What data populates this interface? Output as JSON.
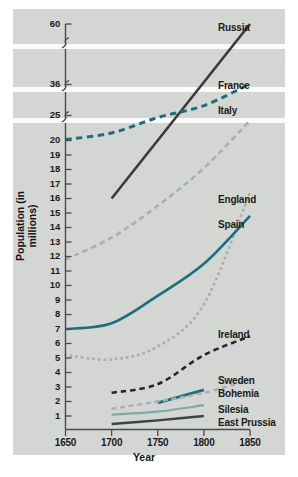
{
  "chart_data": {
    "type": "line",
    "title": "",
    "xlabel": "Year",
    "ylabel": "Population (in millions)",
    "grid": false,
    "legend_position": "right-inline-labels",
    "x_ticks": [
      "1650",
      "1700",
      "1750",
      "1800",
      "1850"
    ],
    "xlim": [
      1650,
      1850
    ],
    "y_ticks": [
      "1",
      "2",
      "3",
      "4",
      "5",
      "6",
      "7",
      "8",
      "9",
      "10",
      "11",
      "12",
      "13",
      "14",
      "15",
      "16",
      "17",
      "18",
      "19",
      "20",
      "25",
      "36",
      "60"
    ],
    "y_axis_note": "broken axis: three break marks between 20 and 25, between 25 and 36, and between 36 and 60",
    "series": [
      {
        "name": "Russia",
        "style": "solid",
        "color": "#3a3a3c",
        "width": 2.6,
        "points": [
          [
            1700,
            16.0
          ],
          [
            1850,
            60.0
          ]
        ]
      },
      {
        "name": "France",
        "style": "dashed",
        "color": "#1b6f7e",
        "width": 3.0,
        "points": [
          [
            1650,
            20.2
          ],
          [
            1700,
            21.5
          ],
          [
            1750,
            24.6
          ],
          [
            1800,
            28.5
          ],
          [
            1850,
            36.3
          ]
        ]
      },
      {
        "name": "Italy",
        "style": "dashed",
        "color": "#a9aeb0",
        "width": 2.6,
        "points": [
          [
            1650,
            11.8
          ],
          [
            1700,
            13.3
          ],
          [
            1750,
            15.5
          ],
          [
            1800,
            18.1
          ],
          [
            1850,
            24.0
          ]
        ]
      },
      {
        "name": "England",
        "style": "dotted",
        "color": "#a9aeb0",
        "width": 3.0,
        "points": [
          [
            1650,
            5.2
          ],
          [
            1700,
            4.9
          ],
          [
            1750,
            5.8
          ],
          [
            1800,
            8.7
          ],
          [
            1850,
            16.4
          ]
        ]
      },
      {
        "name": "Spain",
        "style": "solid",
        "color": "#1b6f7e",
        "width": 2.6,
        "points": [
          [
            1650,
            7.0
          ],
          [
            1700,
            7.4
          ],
          [
            1750,
            9.3
          ],
          [
            1800,
            11.5
          ],
          [
            1850,
            14.8
          ]
        ]
      },
      {
        "name": "Ireland",
        "style": "dashed",
        "color": "#26262a",
        "width": 2.6,
        "points": [
          [
            1700,
            2.6
          ],
          [
            1750,
            3.2
          ],
          [
            1800,
            5.2
          ],
          [
            1850,
            6.5
          ]
        ]
      },
      {
        "name": "Sweden",
        "style": "solid",
        "color": "#1b6f7e",
        "width": 2.8,
        "points": [
          [
            1750,
            1.9
          ],
          [
            1800,
            2.8
          ]
        ]
      },
      {
        "name": "Bohemia",
        "style": "dashed",
        "color": "#a9aeb0",
        "width": 2.4,
        "points": [
          [
            1700,
            1.5
          ],
          [
            1750,
            2.0
          ],
          [
            1800,
            2.6
          ],
          [
            1850,
            3.5
          ]
        ]
      },
      {
        "name": "Silesia",
        "style": "solid",
        "color": "#7fa8ad",
        "width": 2.2,
        "points": [
          [
            1700,
            1.1
          ],
          [
            1750,
            1.3
          ],
          [
            1800,
            1.75
          ]
        ]
      },
      {
        "name": "East Prussia",
        "style": "solid",
        "color": "#3d4548",
        "width": 2.4,
        "points": [
          [
            1700,
            0.45
          ],
          [
            1750,
            0.7
          ],
          [
            1800,
            1.0
          ]
        ]
      }
    ],
    "series_labels": [
      {
        "name": "Russia",
        "x": 218,
        "y": 22
      },
      {
        "name": "France",
        "x": 218,
        "y": 80
      },
      {
        "name": "Italy",
        "x": 218,
        "y": 105
      },
      {
        "name": "England",
        "x": 218,
        "y": 194
      },
      {
        "name": "Spain",
        "x": 218,
        "y": 219
      },
      {
        "name": "Ireland",
        "x": 218,
        "y": 329
      },
      {
        "name": "Sweden",
        "x": 218,
        "y": 375
      },
      {
        "name": "Bohemia",
        "x": 218,
        "y": 388
      },
      {
        "name": "Silesia",
        "x": 218,
        "y": 404
      },
      {
        "name": "East Prussia",
        "x": 218,
        "y": 417
      }
    ]
  },
  "axes": {
    "x_title": "Year",
    "y_title": "Population (in millions)",
    "x_tick_labels": [
      "1650",
      "1700",
      "1750",
      "1800",
      "1850"
    ],
    "y_tick_labels_top": [
      "60",
      "36",
      "25"
    ],
    "y_tick_labels_main": [
      "20",
      "19",
      "18",
      "17",
      "16",
      "15",
      "14",
      "13",
      "12",
      "11",
      "10",
      "9",
      "8",
      "7",
      "6",
      "5",
      "4",
      "3",
      "2",
      "1"
    ]
  },
  "colors": {
    "panel": "#d4d6d4",
    "page": "#ffffff",
    "teal": "#1b6f7e",
    "gray": "#a9aeb0",
    "dark": "#3a3a3c",
    "light_teal": "#7fa8ad",
    "axis": "#4a4a4c",
    "text": "#1b1b1b"
  }
}
